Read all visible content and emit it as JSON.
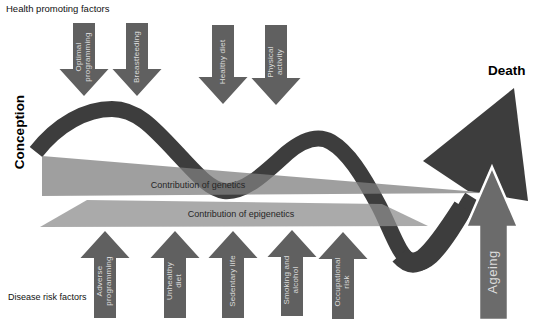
{
  "diagram_title": "Life course of health: factors acting between conception and death",
  "timeline": {
    "start_label": "Conception",
    "end_label": "Death"
  },
  "health_promoting": {
    "section_label": "Health promoting factors",
    "arrows": [
      {
        "label": "Optimal programming",
        "lines": [
          "Optimal",
          "programming"
        ]
      },
      {
        "label": "Breastfeeding",
        "lines": [
          "Breastfeeding"
        ]
      },
      {
        "label": "Healthy diet",
        "lines": [
          "Healthy diet"
        ]
      },
      {
        "label": "Physical activity",
        "lines": [
          "Physical",
          "activity"
        ]
      }
    ]
  },
  "disease_risk": {
    "section_label": "Disease risk factors",
    "arrows": [
      {
        "label": "Adverse programming",
        "lines": [
          "Adverse",
          "programming"
        ]
      },
      {
        "label": "Unhealthy diet",
        "lines": [
          "Unhealthy",
          "diet"
        ]
      },
      {
        "label": "Sedentary life",
        "lines": [
          "Sedentary life"
        ]
      },
      {
        "label": "Smoking and alcohol",
        "lines": [
          "Smoking and",
          "alcohol"
        ]
      },
      {
        "label": "Occupational risk",
        "lines": [
          "Occupational",
          "risk"
        ]
      }
    ]
  },
  "bands": {
    "genetics_label": "Contribution of genetics",
    "epigenetics_label": "Contribution of epigenetics"
  },
  "ageing": {
    "label": "Ageing"
  },
  "colors": {
    "background": "#ffffff",
    "wave_arrow": "#3d3d3d",
    "factor_arrow": "#606060",
    "ageing_arrow": "#6b6b6b",
    "genetics_band": "#7f7f7f",
    "epigenetics_band": "#8e8e8e",
    "arrow_text": "#dcdcdc",
    "band_text": "#262626",
    "label_text": "#111111"
  }
}
